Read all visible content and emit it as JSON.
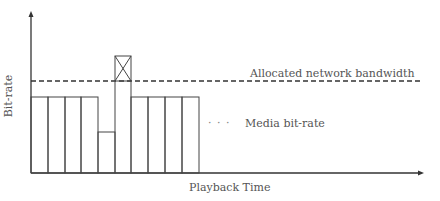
{
  "diagram": {
    "y_axis_label": "Bit-rate",
    "x_axis_label": "Playback Time",
    "legend": {
      "bandwidth_label": "Allocated network bandwidth",
      "media_label": "Media bit-rate",
      "media_marker": "· · ·"
    },
    "segments": [
      {
        "index": 1,
        "level": "normal"
      },
      {
        "index": 2,
        "level": "normal"
      },
      {
        "index": 3,
        "level": "normal"
      },
      {
        "index": 4,
        "level": "normal"
      },
      {
        "index": 5,
        "level": "low"
      },
      {
        "index": 6,
        "level": "high",
        "exceeds_bandwidth": true
      },
      {
        "index": 7,
        "level": "normal"
      },
      {
        "index": 8,
        "level": "normal"
      },
      {
        "index": 9,
        "level": "normal"
      },
      {
        "index": 10,
        "level": "normal"
      }
    ]
  }
}
